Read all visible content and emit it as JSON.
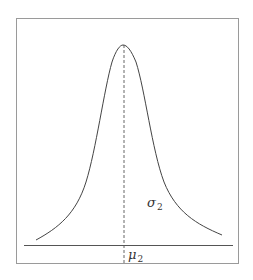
{
  "figure": {
    "frame": {
      "x": 16,
      "y": 18,
      "width": 223,
      "height": 246,
      "stroke": "#9a9a9a"
    },
    "baseline": {
      "x1": 24,
      "x2": 233,
      "y": 245,
      "stroke": "#555555"
    },
    "curve": {
      "type": "symmetric peak (Lorentzian-like)",
      "peak": {
        "x": 123,
        "y": 45
      },
      "left_end": {
        "x": 36,
        "y": 240
      },
      "right_end": {
        "x": 222,
        "y": 235
      },
      "stroke": "#444444"
    },
    "mean_line": {
      "x": 124,
      "y1": 45,
      "y2": 262,
      "style": "dashed",
      "stroke": "#555555"
    },
    "labels": {
      "sigma": {
        "symbol": "σ",
        "subscript": "2"
      },
      "mu": {
        "symbol": "μ",
        "subscript": "2"
      }
    }
  }
}
